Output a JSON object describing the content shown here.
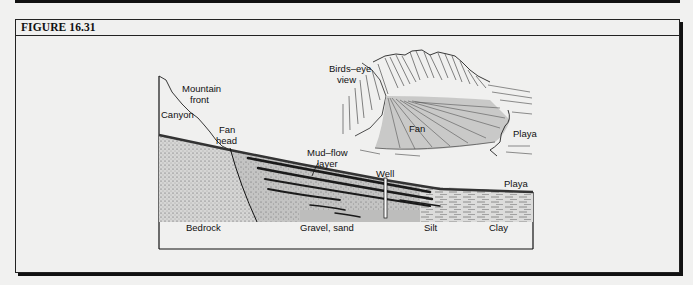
{
  "figure": {
    "title": "FIGURE 16.31"
  },
  "cross_section": {
    "labels": {
      "mountain_front_1": "Mountain",
      "mountain_front_2": "front",
      "canyon": "Canyon",
      "fan_head_1": "Fan",
      "fan_head_2": "head",
      "mudflow_1": "Mud–flow",
      "mudflow_2": "layer",
      "well": "Well",
      "playa": "Playa",
      "bedrock": "Bedrock",
      "gravel_sand": "Gravel, sand",
      "silt": "Silt",
      "clay": "Clay"
    }
  },
  "birds_eye": {
    "labels": {
      "title_1": "Birds–eye",
      "title_2": "view",
      "fan": "Fan",
      "playa": "Playa"
    }
  },
  "colors": {
    "line": "#111111",
    "fan_gray": "#c9c9c8",
    "band_dark": "#1a1a1a",
    "background": "#f0f0ef"
  }
}
